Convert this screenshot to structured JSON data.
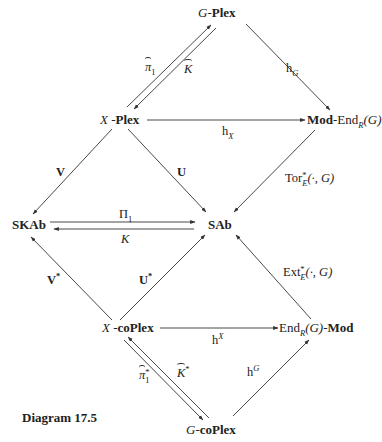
{
  "diagram": {
    "caption": "Diagram 17.5",
    "nodes": {
      "g_plex": {
        "prefix": "G",
        "sep": "-",
        "main": "Plex"
      },
      "x_plex": {
        "prefix": "X",
        "sep": " -",
        "main": "Plex"
      },
      "mod_end": {
        "main": "Mod",
        "sep": "-End",
        "sub": "R",
        "arg": "(G)"
      },
      "skab": {
        "main": "SKAb"
      },
      "sab": {
        "main": "SAb"
      },
      "x_coplex": {
        "prefix": "X",
        "sep": " -",
        "main": "coPlex"
      },
      "end_mod": {
        "pre": "End",
        "sub": "R",
        "arg": "(G)-",
        "main": "Mod"
      },
      "g_coplex": {
        "prefix": "G",
        "sep": "-",
        "main": "coPlex"
      }
    },
    "arrows": {
      "pi1_hat": {
        "sym": "π",
        "sub": "1"
      },
      "k_hat": {
        "sym": "K"
      },
      "h_G": {
        "base": "h",
        "sub": "G"
      },
      "h_X": {
        "base": "h",
        "sub": "X"
      },
      "V": {
        "label": "V"
      },
      "U": {
        "label": "U"
      },
      "tor": {
        "base": "Tor",
        "sup": "*",
        "sub": "E",
        "arg": "(·, G)"
      },
      "Pi1": {
        "base": "Π",
        "sub": "1"
      },
      "K": {
        "label": "K"
      },
      "V_star": {
        "label": "V",
        "sup": "*"
      },
      "U_star": {
        "label": "U",
        "sup": "*"
      },
      "ext": {
        "base": "Ext",
        "sup": "*",
        "sub": "E",
        "arg": "(·, G)"
      },
      "h_upX": {
        "base": "h",
        "sup": "X"
      },
      "pi1_star_hat": {
        "sym": "π",
        "sub": "1",
        "sup": "*"
      },
      "k_star_hat": {
        "sym": "K",
        "sup": "*"
      },
      "h_upG": {
        "base": "h",
        "sup": "G"
      }
    },
    "colors": {
      "line": "#333333",
      "text": "#222222",
      "background": "#ffffff"
    }
  }
}
